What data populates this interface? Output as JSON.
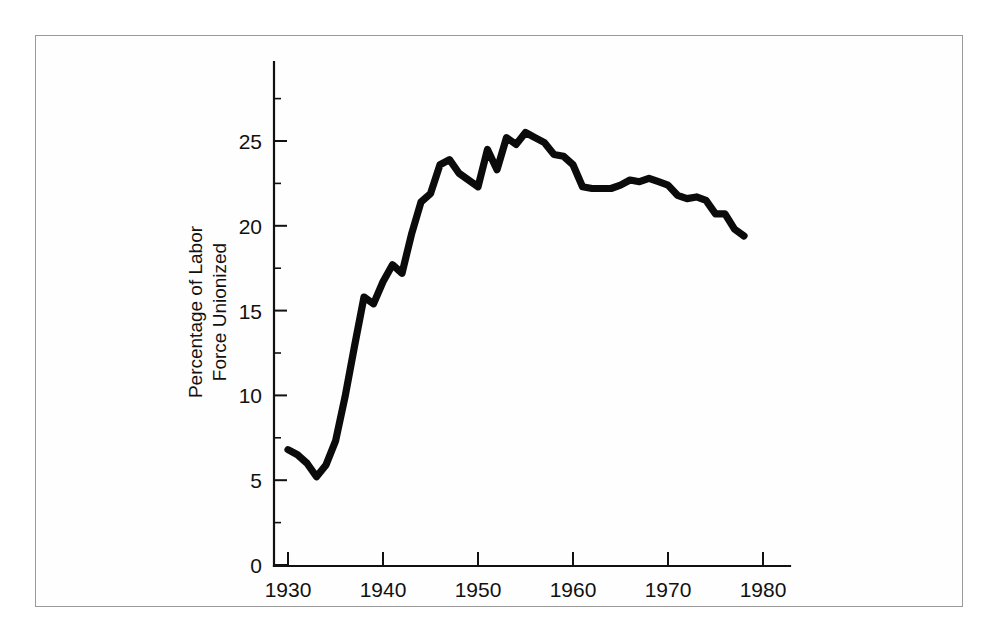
{
  "figure": {
    "background_color": "#ffffff",
    "frame_color": "#9a9a9a",
    "line_color": "#0b0b0b"
  },
  "chart_data": {
    "type": "line",
    "title": "",
    "xlabel": "",
    "ylabel": "Percentage of Labor Force Unionized",
    "ylabel_line1": "Percentage of Labor",
    "ylabel_line2": "Force Unionized",
    "xlim": [
      1928,
      1983
    ],
    "ylim": [
      0,
      28.5
    ],
    "grid": false,
    "legend": "none",
    "x_ticks": [
      1930,
      1940,
      1950,
      1960,
      1970,
      1980
    ],
    "x_tick_labels": [
      "1930",
      "1940",
      "1950",
      "1960",
      "1970",
      "1980"
    ],
    "y_ticks": [
      0,
      5,
      10,
      15,
      20,
      25
    ],
    "y_tick_labels": [
      "0",
      "5",
      "10",
      "15",
      "20",
      "25"
    ],
    "y_minor_ticks": [
      2.5,
      7.5,
      12.5,
      17.5,
      22.5,
      27.5
    ],
    "series": [
      {
        "name": "Percentage of Labor Force Unionized",
        "x": [
          1930,
          1931,
          1932,
          1933,
          1934,
          1935,
          1936,
          1937,
          1938,
          1939,
          1940,
          1941,
          1942,
          1943,
          1944,
          1945,
          1946,
          1947,
          1948,
          1949,
          1950,
          1951,
          1952,
          1953,
          1954,
          1955,
          1956,
          1957,
          1958,
          1959,
          1960,
          1961,
          1962,
          1963,
          1964,
          1965,
          1966,
          1967,
          1968,
          1969,
          1970,
          1971,
          1972,
          1973,
          1974,
          1975,
          1976,
          1977,
          1978
        ],
        "values": [
          6.8,
          6.5,
          6.0,
          5.2,
          5.9,
          7.3,
          9.9,
          12.9,
          15.8,
          15.4,
          16.7,
          17.7,
          17.2,
          19.5,
          21.4,
          21.9,
          23.6,
          23.9,
          23.1,
          22.7,
          22.3,
          24.5,
          23.3,
          25.2,
          24.8,
          25.5,
          25.2,
          24.9,
          24.2,
          24.1,
          23.6,
          22.3,
          22.2,
          22.2,
          22.2,
          22.4,
          22.7,
          22.6,
          22.8,
          22.6,
          22.4,
          21.8,
          21.6,
          21.7,
          21.5,
          20.7,
          20.7,
          19.8,
          19.4
        ]
      }
    ]
  }
}
